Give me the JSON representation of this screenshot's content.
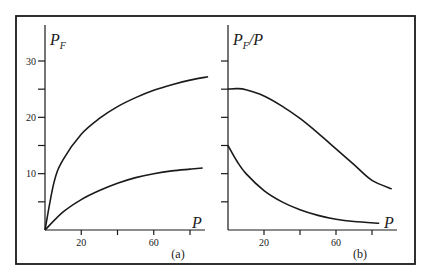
{
  "chart_data": [
    {
      "type": "line",
      "panel_label": "(a)",
      "title": "",
      "xlabel": "P",
      "ylabel": "P_F",
      "ylabel_main": "P",
      "ylabel_sub": "F",
      "xlim": [
        0,
        90
      ],
      "ylim": [
        0,
        35
      ],
      "x_ticks": [
        0,
        20,
        40,
        60,
        80
      ],
      "x_tick_labels": [
        "",
        "20",
        "",
        "60",
        ""
      ],
      "y_ticks": [
        0,
        5,
        10,
        15,
        20,
        25,
        30
      ],
      "y_tick_labels": [
        "",
        "",
        "10",
        "",
        "20",
        "",
        "30"
      ],
      "grid": false,
      "series": [
        {
          "name": "upper curve",
          "x": [
            0,
            5,
            10,
            20,
            30,
            40,
            50,
            60,
            70,
            80,
            90
          ],
          "y": [
            0,
            8.5,
            12.5,
            17.0,
            19.8,
            21.9,
            23.5,
            24.8,
            25.8,
            26.6,
            27.2
          ]
        },
        {
          "name": "lower curve",
          "x": [
            0,
            10,
            20,
            30,
            40,
            50,
            60,
            70,
            80,
            87
          ],
          "y": [
            0,
            3.2,
            5.4,
            7.0,
            8.3,
            9.3,
            10.0,
            10.5,
            10.8,
            11.0
          ]
        }
      ]
    },
    {
      "type": "line",
      "panel_label": "(b)",
      "title": "",
      "xlabel": "P",
      "ylabel": "P_F/P",
      "ylabel_main": "P",
      "ylabel_sub": "F",
      "ylabel_tail": "/P",
      "xlim": [
        0,
        90
      ],
      "ylim": [
        0,
        35
      ],
      "x_ticks": [
        0,
        20,
        40,
        60,
        80
      ],
      "x_tick_labels": [
        "",
        "20",
        "",
        "60",
        ""
      ],
      "y_ticks": [
        0,
        5,
        10,
        15,
        20,
        25,
        30
      ],
      "y_tick_labels": [
        "",
        "",
        "",
        "",
        "",
        "",
        ""
      ],
      "grid": false,
      "series": [
        {
          "name": "upper curve",
          "x": [
            0,
            5,
            10,
            20,
            30,
            40,
            50,
            60,
            70,
            80,
            91
          ],
          "y": [
            25.0,
            25.1,
            24.9,
            23.8,
            22.0,
            19.8,
            17.2,
            14.4,
            11.6,
            8.8,
            7.3
          ]
        },
        {
          "name": "lower curve",
          "x": [
            0,
            5,
            10,
            20,
            30,
            40,
            50,
            60,
            70,
            84
          ],
          "y": [
            15.0,
            12.2,
            10.0,
            7.0,
            5.0,
            3.6,
            2.6,
            1.9,
            1.5,
            1.2
          ]
        }
      ]
    }
  ]
}
